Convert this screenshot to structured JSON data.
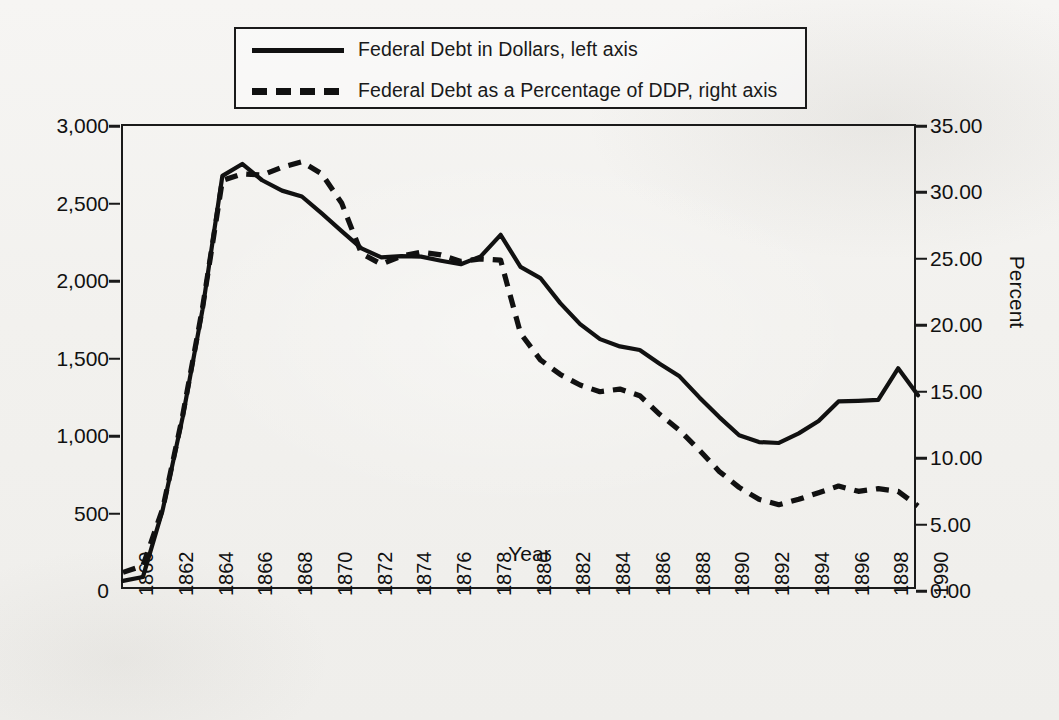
{
  "legend": {
    "entries": [
      {
        "style": "solid",
        "label": "Federal Debt in Dollars,  left axis"
      },
      {
        "style": "dashed",
        "label": "Federal Debt as a Percentage of DDP, right axis"
      }
    ]
  },
  "axes": {
    "x_title": "Year",
    "y_left_ticks": [
      "0",
      "500",
      "1,000",
      "1,500",
      "2,000",
      "2,500",
      "3,000"
    ],
    "y_right_title": "Percent",
    "y_right_ticks": [
      "0.00",
      "5.00",
      "10.00",
      "15.00",
      "20.00",
      "25.00",
      "30.00",
      "35.00"
    ],
    "x_ticks": [
      "1860",
      "1862",
      "1864",
      "1866",
      "1868",
      "1870",
      "1872",
      "1874",
      "1876",
      "1878",
      "1880",
      "1882",
      "1884",
      "1886",
      "1888",
      "1890",
      "1892",
      "1894",
      "1896",
      "1898",
      "1990"
    ]
  },
  "colors": {
    "ink": "#1a1a1a",
    "paper": "#f4f3f1"
  },
  "chart_data": {
    "type": "line",
    "title": "",
    "xlabel": "Year",
    "ylabel": "",
    "y2label": "Percent",
    "ylim": [
      0,
      3000
    ],
    "y2lim": [
      0,
      35
    ],
    "xlim": [
      1860,
      1900
    ],
    "grid": false,
    "legend_position": "top",
    "x": [
      1860,
      1861,
      1862,
      1863,
      1864,
      1865,
      1866,
      1867,
      1868,
      1869,
      1870,
      1871,
      1872,
      1873,
      1874,
      1875,
      1876,
      1877,
      1878,
      1879,
      1880,
      1881,
      1882,
      1883,
      1884,
      1885,
      1886,
      1887,
      1888,
      1889,
      1890,
      1891,
      1892,
      1893,
      1894,
      1895,
      1896,
      1897,
      1898,
      1899,
      1900
    ],
    "series": [
      {
        "name": "Federal Debt in Dollars,  left axis",
        "axis": "left",
        "style": "solid",
        "units": "millions of dollars",
        "values": [
          65,
          90,
          525,
          1120,
          1816,
          2678,
          2755,
          2650,
          2583,
          2545,
          2436,
          2322,
          2210,
          2152,
          2160,
          2157,
          2131,
          2108,
          2159,
          2298,
          2091,
          2019,
          1857,
          1722,
          1625,
          1578,
          1555,
          1466,
          1385,
          1249,
          1122,
          1005,
          961,
          955,
          1017,
          1097,
          1223,
          1227,
          1233,
          1437,
          1263
        ]
      },
      {
        "name": "Federal Debt as a Percentage of DDP, right axis",
        "axis": "right",
        "style": "dashed",
        "units": "percent",
        "values": [
          1.4,
          1.9,
          6.2,
          13.2,
          21.3,
          30.9,
          31.4,
          31.3,
          31.9,
          32.3,
          31.4,
          29.2,
          25.4,
          24.6,
          25.2,
          25.5,
          25.3,
          24.8,
          25.0,
          24.9,
          19.4,
          17.4,
          16.3,
          15.5,
          15.0,
          15.2,
          14.7,
          13.3,
          12.1,
          10.6,
          9.0,
          7.8,
          6.9,
          6.5,
          6.9,
          7.4,
          7.9,
          7.5,
          7.7,
          7.5,
          6.4
        ]
      }
    ]
  }
}
